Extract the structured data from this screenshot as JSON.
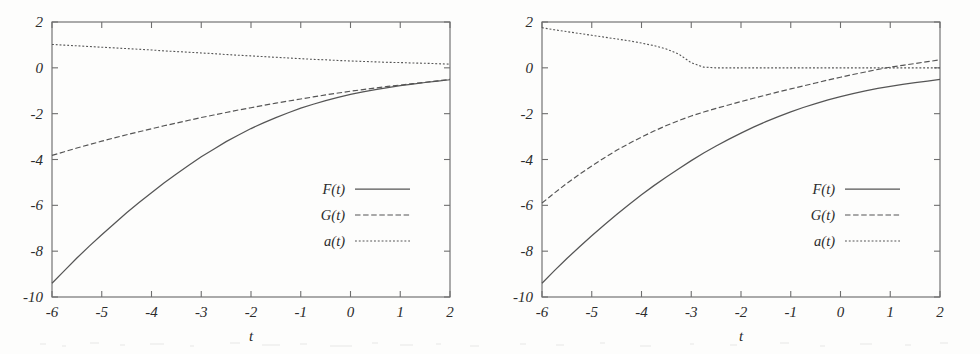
{
  "figure": {
    "type": "two-panel-line-chart",
    "background": "#fdfdfc",
    "line_color": "#555555",
    "axis_color": "#6e6e6e",
    "text_color": "#2b2b2b"
  },
  "chart_data": [
    {
      "type": "line",
      "panel": "left",
      "title": "",
      "xlabel": "t",
      "ylabel": "",
      "xlim": [
        -6,
        2
      ],
      "ylim": [
        -10,
        2
      ],
      "xticks": [
        -6,
        -5,
        -4,
        -3,
        -2,
        -1,
        0,
        1,
        2
      ],
      "xtick_labels": [
        "-6",
        "-5",
        "-4",
        "-3",
        "-2",
        "-1",
        "0",
        "1",
        "2"
      ],
      "yticks": [
        2,
        0,
        -2,
        -4,
        -6,
        -8,
        -10
      ],
      "ytick_labels": [
        "2",
        "0",
        "-2",
        "-4",
        "-6",
        "-8",
        "-10"
      ],
      "grid": false,
      "legend_position": "center-right",
      "x": [
        -6,
        -5.75,
        -5.5,
        -5.25,
        -5,
        -4.75,
        -4.5,
        -4.25,
        -4,
        -3.75,
        -3.5,
        -3.25,
        -3,
        -2.75,
        -2.5,
        -2.25,
        -2,
        -1.75,
        -1.5,
        -1.25,
        -1,
        -0.75,
        -0.5,
        -0.25,
        0,
        0.25,
        0.5,
        0.75,
        1,
        1.25,
        1.5,
        1.75,
        2
      ],
      "series": [
        {
          "name": "F(t)",
          "style": "solid",
          "values": [
            -9.4,
            -8.85,
            -8.3,
            -7.78,
            -7.28,
            -6.8,
            -6.32,
            -5.88,
            -5.45,
            -5.03,
            -4.63,
            -4.25,
            -3.88,
            -3.55,
            -3.22,
            -2.93,
            -2.65,
            -2.4,
            -2.17,
            -1.96,
            -1.76,
            -1.59,
            -1.43,
            -1.29,
            -1.16,
            -1.05,
            -0.95,
            -0.86,
            -0.78,
            -0.71,
            -0.64,
            -0.58,
            -0.52
          ]
        },
        {
          "name": "G(t)",
          "style": "dashed",
          "values": [
            -3.82,
            -3.66,
            -3.5,
            -3.35,
            -3.2,
            -3.06,
            -2.92,
            -2.79,
            -2.66,
            -2.53,
            -2.41,
            -2.29,
            -2.17,
            -2.06,
            -1.95,
            -1.84,
            -1.74,
            -1.64,
            -1.54,
            -1.45,
            -1.36,
            -1.27,
            -1.18,
            -1.1,
            -1.02,
            -0.95,
            -0.88,
            -0.81,
            -0.75,
            -0.69,
            -0.63,
            -0.57,
            -0.5
          ]
        },
        {
          "name": "a(t)",
          "style": "dotted",
          "values": [
            1.02,
            0.99,
            0.96,
            0.93,
            0.9,
            0.87,
            0.84,
            0.81,
            0.78,
            0.74,
            0.71,
            0.68,
            0.65,
            0.62,
            0.58,
            0.55,
            0.52,
            0.49,
            0.46,
            0.43,
            0.4,
            0.37,
            0.35,
            0.32,
            0.3,
            0.28,
            0.26,
            0.24,
            0.23,
            0.21,
            0.2,
            0.18,
            0.16
          ]
        }
      ]
    },
    {
      "type": "line",
      "panel": "right",
      "title": "",
      "xlabel": "t",
      "ylabel": "",
      "xlim": [
        -6,
        2
      ],
      "ylim": [
        -10,
        2
      ],
      "xticks": [
        -6,
        -5,
        -4,
        -3,
        -2,
        -1,
        0,
        1,
        2
      ],
      "xtick_labels": [
        "-6",
        "-5",
        "-4",
        "-3",
        "-2",
        "-1",
        "0",
        "1",
        "2"
      ],
      "yticks": [
        2,
        0,
        -2,
        -4,
        -6,
        -8,
        -10
      ],
      "ytick_labels": [
        "2",
        "0",
        "-2",
        "-4",
        "-6",
        "-8",
        "-10"
      ],
      "grid": false,
      "legend_position": "center-right",
      "x": [
        -6,
        -5.75,
        -5.5,
        -5.25,
        -5,
        -4.75,
        -4.5,
        -4.25,
        -4,
        -3.75,
        -3.5,
        -3.25,
        -3,
        -2.75,
        -2.5,
        -2.25,
        -2,
        -1.75,
        -1.5,
        -1.25,
        -1,
        -0.75,
        -0.5,
        -0.25,
        0,
        0.25,
        0.5,
        0.75,
        1,
        1.25,
        1.5,
        1.75,
        2
      ],
      "series": [
        {
          "name": "F(t)",
          "style": "solid",
          "values": [
            -9.4,
            -8.85,
            -8.32,
            -7.82,
            -7.33,
            -6.86,
            -6.4,
            -5.96,
            -5.54,
            -5.14,
            -4.76,
            -4.4,
            -4.05,
            -3.72,
            -3.41,
            -3.12,
            -2.85,
            -2.59,
            -2.35,
            -2.13,
            -1.92,
            -1.73,
            -1.56,
            -1.4,
            -1.26,
            -1.13,
            -1.01,
            -0.9,
            -0.81,
            -0.72,
            -0.65,
            -0.58,
            -0.5
          ]
        },
        {
          "name": "G(t)",
          "style": "dashed",
          "values": [
            -5.9,
            -5.46,
            -5.04,
            -4.65,
            -4.28,
            -3.93,
            -3.6,
            -3.3,
            -3.02,
            -2.76,
            -2.52,
            -2.3,
            -2.1,
            -1.93,
            -1.77,
            -1.62,
            -1.47,
            -1.33,
            -1.19,
            -1.05,
            -0.92,
            -0.79,
            -0.66,
            -0.53,
            -0.41,
            -0.29,
            -0.18,
            -0.07,
            0.03,
            0.11,
            0.19,
            0.27,
            0.35
          ]
        },
        {
          "name": "a(t)",
          "style": "dotted",
          "values": [
            1.75,
            1.66,
            1.58,
            1.5,
            1.42,
            1.34,
            1.26,
            1.18,
            1.08,
            0.97,
            0.82,
            0.6,
            0.22,
            0.03,
            0.0,
            0.0,
            0.0,
            0.0,
            0.0,
            0.0,
            0.0,
            0.0,
            0.0,
            0.0,
            0.0,
            0.0,
            0.0,
            0.0,
            0.0,
            0.0,
            0.0,
            0.0,
            0.0
          ]
        }
      ]
    }
  ]
}
